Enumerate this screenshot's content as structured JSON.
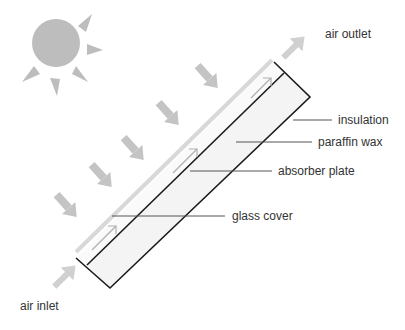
{
  "diagram": {
    "type": "solar air collector cross-section",
    "labels": {
      "air_outlet": "air outlet",
      "insulation": "insulation",
      "paraffin_wax": "paraffin wax",
      "absorber_plate": "absorber plate",
      "glass_cover": "glass cover",
      "air_inlet": "air inlet"
    },
    "icons": {
      "sun": "sun-icon",
      "radiation": "radiation-arrow-icon",
      "airflow": "airflow-arrow-icon"
    },
    "colors": {
      "outline": "#1a1a1a",
      "sun": "#bdbdbd",
      "arrows": "#c4c4c4",
      "fill": "#f4f4f4",
      "glass": "#d8d8d8",
      "leader": "#555555",
      "text": "#333333"
    }
  }
}
